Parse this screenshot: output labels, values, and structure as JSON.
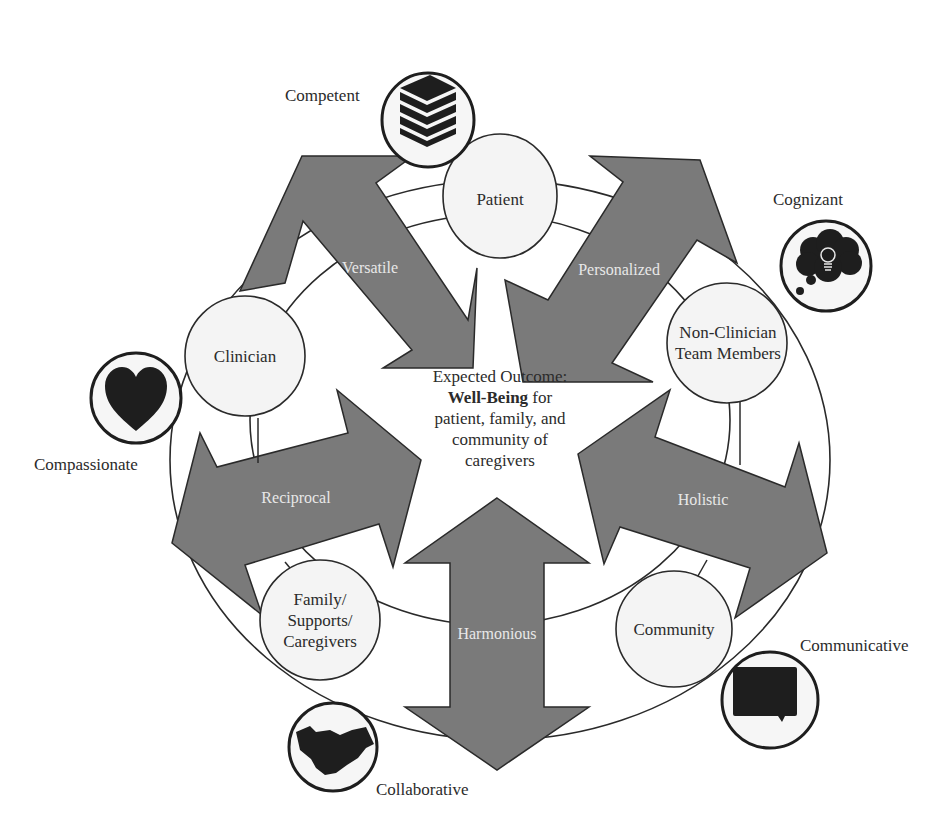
{
  "diagram": {
    "center": {
      "line1": "Expected Outcome:",
      "bold": "Well-Being",
      "line2_rest": " for",
      "line3": "patient, family, and",
      "line4": "community of",
      "line5": "caregivers"
    },
    "nodes": [
      {
        "id": "patient",
        "lines": [
          "Patient"
        ]
      },
      {
        "id": "clinician",
        "lines": [
          "Clinician"
        ]
      },
      {
        "id": "non-clinician",
        "lines": [
          "Non-Clinician",
          "Team Members"
        ]
      },
      {
        "id": "family",
        "lines": [
          "Family/",
          "Supports/",
          "Caregivers"
        ]
      },
      {
        "id": "community",
        "lines": [
          "Community"
        ]
      }
    ],
    "arrows": [
      {
        "id": "versatile",
        "label": "Versatile"
      },
      {
        "id": "personalized",
        "label": "Personalized"
      },
      {
        "id": "reciprocal",
        "label": "Reciprocal"
      },
      {
        "id": "holistic",
        "label": "Holistic"
      },
      {
        "id": "harmonious",
        "label": "Harmonious"
      }
    ],
    "attributes": [
      {
        "id": "competent",
        "label": "Competent",
        "icon": "books-icon"
      },
      {
        "id": "cognizant",
        "label": "Cognizant",
        "icon": "thought-bubble-lightbulb-icon"
      },
      {
        "id": "compassionate",
        "label": "Compassionate",
        "icon": "heart-icon"
      },
      {
        "id": "communicative",
        "label": "Communicative",
        "icon": "speech-bubble-icon"
      },
      {
        "id": "collaborative",
        "label": "Collaborative",
        "icon": "handshake-icon"
      }
    ],
    "colors": {
      "arrow_fill": "#7a7a7a",
      "arrow_stroke": "#2a2a2a",
      "node_fill": "#f4f4f4",
      "line": "#2a2a2a",
      "icon": "#1e1e1e",
      "arrow_text": "#e8e8e8"
    }
  }
}
